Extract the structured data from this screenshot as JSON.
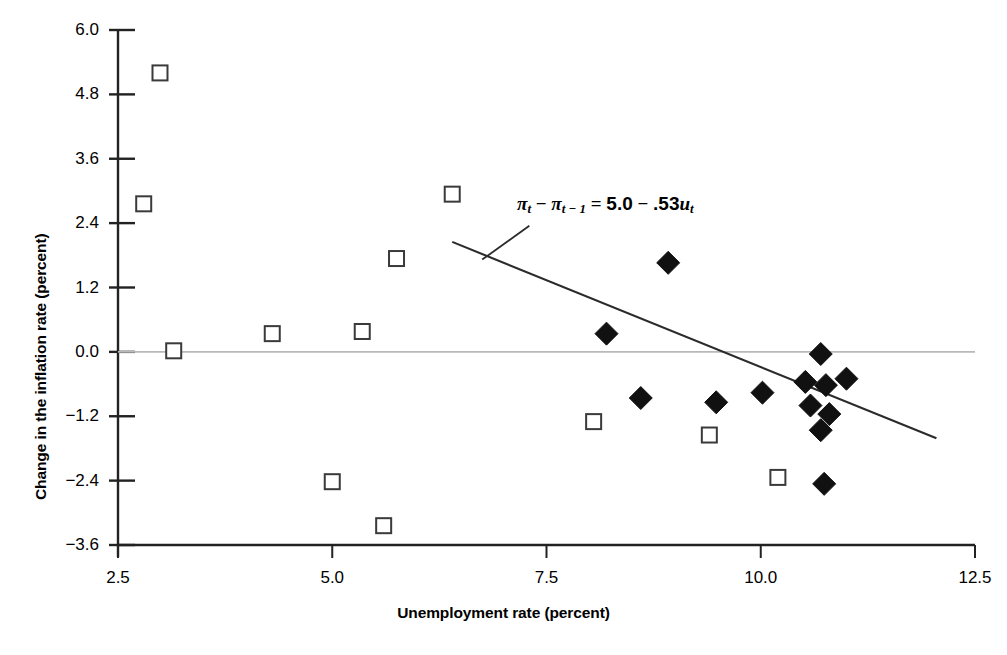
{
  "chart_data": {
    "type": "scatter",
    "title": "",
    "xlabel": "Unemployment rate (percent)",
    "ylabel": "Change in the inflation rate (percent)",
    "xlim": [
      2.5,
      12.5
    ],
    "ylim": [
      -3.6,
      6.0
    ],
    "xticks": [
      "2.5",
      "5.0",
      "7.5",
      "10.0",
      "12.5"
    ],
    "xtick_values": [
      2.5,
      5.0,
      7.5,
      10.0,
      12.5
    ],
    "yticks": [
      "6.0",
      "4.8",
      "3.6",
      "2.4",
      "1.2",
      "0.0",
      "−1.2",
      "−2.4",
      "−3.6"
    ],
    "ytick_values": [
      6.0,
      4.8,
      3.6,
      2.4,
      1.2,
      0.0,
      -1.2,
      -2.4,
      -3.6
    ],
    "grid": false,
    "zero_line": true,
    "legend": "none",
    "annotation": {
      "text": "πt − πt−1 = 5.0 − .53ut",
      "intercept": 5.0,
      "slope": -0.53,
      "leader_from": [
        6.75,
        1.72
      ],
      "leader_to": [
        7.3,
        2.35
      ]
    },
    "fit_line": {
      "x_start": 6.4,
      "y_start": 2.05,
      "x_end": 12.05,
      "y_end": -1.61,
      "color": "#2b2b2b"
    },
    "series": [
      {
        "name": "open-square",
        "marker": "open-square",
        "color": "#3a3a3a",
        "points": [
          [
            2.99,
            5.2
          ],
          [
            2.8,
            2.76
          ],
          [
            3.15,
            0.02
          ],
          [
            4.3,
            0.34
          ],
          [
            5.0,
            -2.42
          ],
          [
            5.35,
            0.38
          ],
          [
            5.6,
            -3.24
          ],
          [
            5.75,
            1.74
          ],
          [
            6.4,
            2.94
          ],
          [
            8.05,
            -1.3
          ],
          [
            9.4,
            -1.55
          ],
          [
            10.2,
            -2.34
          ]
        ]
      },
      {
        "name": "filled-diamond",
        "marker": "filled-diamond",
        "color": "#111111",
        "points": [
          [
            8.2,
            0.34
          ],
          [
            8.6,
            -0.86
          ],
          [
            8.92,
            1.66
          ],
          [
            9.48,
            -0.94
          ],
          [
            10.02,
            -0.76
          ],
          [
            10.52,
            -0.56
          ],
          [
            10.58,
            -1.0
          ],
          [
            10.7,
            -0.04
          ],
          [
            10.7,
            -1.46
          ],
          [
            10.74,
            -2.46
          ],
          [
            10.76,
            -0.62
          ],
          [
            10.8,
            -1.16
          ],
          [
            11.0,
            -0.5
          ]
        ]
      }
    ]
  },
  "equation": {
    "pi": "π",
    "t": "t",
    "t_minus_1": "t − 1",
    "minus": "−",
    "equals": "=",
    "intercept": "5.0",
    "coefficient": ".53",
    "u": "u"
  },
  "axes": {
    "x_title": "Unemployment rate (percent)",
    "y_title": "Change in the inflation rate (percent)"
  }
}
